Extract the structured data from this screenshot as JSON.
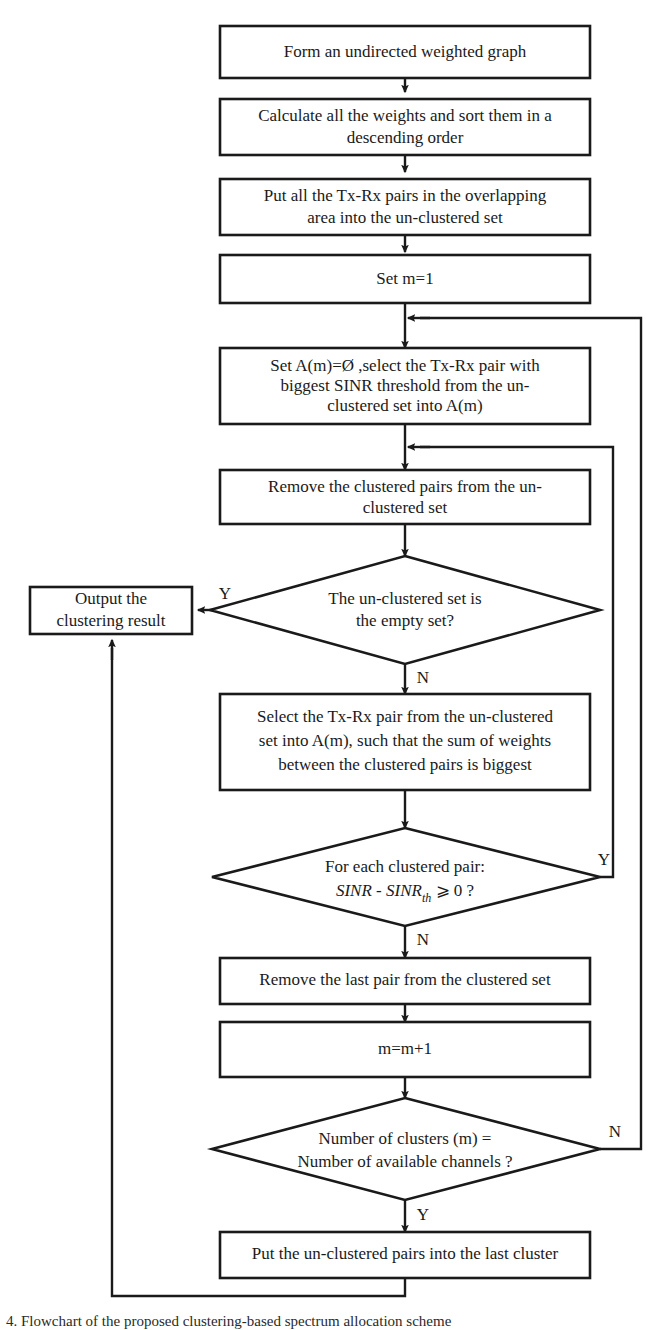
{
  "diagram": {
    "colors": {
      "stroke": "#1a1a1a",
      "fill": "#ffffff",
      "background": "#ffffff"
    },
    "nodes": {
      "n1": {
        "shape": "process",
        "lines": [
          "Form an undirected weighted graph"
        ]
      },
      "n2": {
        "shape": "process",
        "lines": [
          "Calculate all the weights and sort them in a",
          "descending order"
        ]
      },
      "n3": {
        "shape": "process",
        "lines": [
          "Put all the Tx-Rx pairs in the overlapping",
          "area into the un-clustered set"
        ]
      },
      "n4": {
        "shape": "process",
        "lines": [
          "Set m=1"
        ]
      },
      "n5": {
        "shape": "process",
        "lines": [
          "Set A(m)=Ø ,select the Tx-Rx pair with",
          "biggest SINR threshold from the un-",
          "clustered set into A(m)"
        ]
      },
      "n6": {
        "shape": "process",
        "lines": [
          "Remove the clustered pairs from the un-",
          "clustered set"
        ]
      },
      "d1": {
        "shape": "decision",
        "lines": [
          "The un-clustered set is",
          "the empty set?"
        ]
      },
      "out": {
        "shape": "process",
        "lines": [
          "Output the",
          "clustering result"
        ]
      },
      "n7": {
        "shape": "process",
        "lines": [
          "Select the Tx-Rx pair from the un-clustered",
          "set into A(m), such that the sum of weights",
          "between the clustered pairs is biggest"
        ]
      },
      "d2": {
        "shape": "decision",
        "lines": [
          "For each clustered pair:",
          "SINR - SINRth ⩾ 0 ?"
        ],
        "line2_parts": {
          "a": "SINR",
          "b": " - ",
          "c": "SINR",
          "sub": "th",
          "d": " ⩾ 0 ?"
        }
      },
      "n8": {
        "shape": "process",
        "lines": [
          "Remove the last pair from the clustered set"
        ]
      },
      "n9": {
        "shape": "process",
        "lines": [
          "m=m+1"
        ]
      },
      "d3": {
        "shape": "decision",
        "lines": [
          "Number of clusters (m) =",
          "Number of available channels ?"
        ]
      },
      "n10": {
        "shape": "process",
        "lines": [
          "Put the un-clustered pairs into the last cluster"
        ]
      }
    },
    "edge_labels": {
      "d1_yes": "Y",
      "d1_no": "N",
      "d2_yes": "Y",
      "d2_no": "N",
      "d3_yes": "Y",
      "d3_no": "N"
    },
    "caption": "4.  Flowchart of the proposed clustering-based spectrum allocation scheme"
  }
}
